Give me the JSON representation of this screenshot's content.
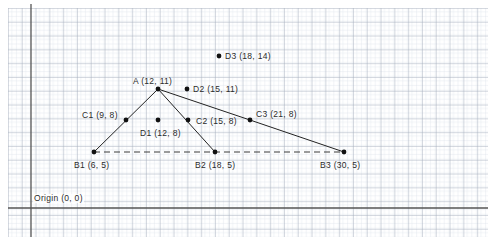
{
  "figure": {
    "origin_label": "Origin (0, 0)",
    "background_color": "#ffffff",
    "grid": {
      "minor_color": "#d7dde6",
      "major_color": "#9aa5b4",
      "minor_spacing_px": 4.6,
      "major_every": 3,
      "offset_x_px": 8,
      "offset_y_px": 8
    },
    "axes": {
      "color": "#555555",
      "x_axis_y_px": 208,
      "y_axis_x_px": 31,
      "units_per_px": 10.5
    },
    "line_color": "#222222",
    "dot_color": "#111111",
    "dashed_color": "#3a3a3a"
  },
  "chart_data": {
    "type": "scatter",
    "xlabel": "",
    "ylabel": "",
    "grid": true,
    "legend": "none",
    "xlim": [
      0,
      43
    ],
    "ylim": [
      0,
      21
    ],
    "origin": {
      "label": "Origin (0, 0)",
      "x": 0,
      "y": 0
    },
    "points": [
      {
        "id": "A",
        "label": "A (12, 11)",
        "x": 12,
        "y": 11,
        "px": 158,
        "py": 89,
        "label_px": 133,
        "label_py": 77,
        "dot": true
      },
      {
        "id": "B1",
        "label": "B1 (6, 5)",
        "x": 6,
        "y": 5,
        "px": 94,
        "py": 152,
        "label_px": 74,
        "label_py": 161,
        "dot": true
      },
      {
        "id": "B2",
        "label": "B2 (18, 5)",
        "x": 18,
        "y": 5,
        "px": 215,
        "py": 152,
        "label_px": 195,
        "label_py": 161,
        "dot": true
      },
      {
        "id": "B3",
        "label": "B3 (30, 5)",
        "x": 30,
        "y": 5,
        "px": 344,
        "py": 152,
        "label_px": 320,
        "label_py": 161,
        "dot": true
      },
      {
        "id": "C1",
        "label": "C1 (9, 8)",
        "x": 9,
        "y": 8,
        "px": 126,
        "py": 120,
        "label_px": 82,
        "label_py": 111,
        "dot": true
      },
      {
        "id": "C2",
        "label": "C2 (15, 8)",
        "x": 15,
        "y": 8,
        "px": 188,
        "py": 120,
        "label_px": 196,
        "label_py": 117,
        "dot": true
      },
      {
        "id": "C3",
        "label": "C3 (21, 8)",
        "x": 21,
        "y": 8,
        "px": 250,
        "py": 120,
        "label_px": 256,
        "label_py": 110,
        "dot": true
      },
      {
        "id": "D1",
        "label": "D1 (12, 8)",
        "x": 12,
        "y": 8,
        "px": 158,
        "py": 120,
        "label_px": 140,
        "label_py": 129,
        "dot": true
      },
      {
        "id": "D2",
        "label": "D2 (15, 11)",
        "x": 15,
        "y": 11,
        "px": 187,
        "py": 89,
        "label_px": 193,
        "label_py": 85,
        "dot": true
      },
      {
        "id": "D3",
        "label": "D3 (18, 14)",
        "x": 18,
        "y": 14,
        "px": 219,
        "py": 56,
        "label_px": 225,
        "label_py": 52,
        "dot": true
      }
    ],
    "segments": [
      {
        "name": "B1-A",
        "from": "B1",
        "to": "A",
        "style": "solid",
        "x1": 94,
        "y1": 152,
        "x2": 158,
        "y2": 89
      },
      {
        "name": "A-C3",
        "from": "A",
        "to": "C3",
        "style": "solid",
        "x1": 158,
        "y1": 89,
        "x2": 250,
        "y2": 120
      },
      {
        "name": "C3-B3",
        "from": "C3",
        "to": "B3",
        "style": "solid",
        "x1": 250,
        "y1": 120,
        "x2": 344,
        "y2": 152
      },
      {
        "name": "A-B2",
        "from": "A",
        "to": "B2",
        "style": "solid",
        "x1": 158,
        "y1": 89,
        "x2": 215,
        "y2": 152
      },
      {
        "name": "B1-B3",
        "from": "B1",
        "to": "B3",
        "style": "dashed",
        "x1": 94,
        "y1": 152,
        "x2": 344,
        "y2": 152
      }
    ]
  }
}
